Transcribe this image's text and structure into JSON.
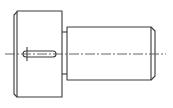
{
  "diagram": {
    "type": "technical-drawing",
    "colors": {
      "background": "#ffffff",
      "line": "#3a3a3a",
      "centerline": "#555555"
    },
    "parts": [
      "head",
      "slot",
      "neck",
      "shaft",
      "chamfer",
      "centerline"
    ]
  }
}
